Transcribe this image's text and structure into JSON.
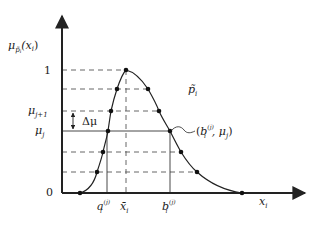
{
  "figure": {
    "type": "membership-function-diagram",
    "colors": {
      "ink": "#222222",
      "dash": "#444444",
      "background": "#ffffff"
    },
    "axes": {
      "y_label": {
        "base": "μ",
        "sub": "p̃",
        "sub2": "i",
        "arg": "(x",
        "arg_sub": "i",
        "close": ")"
      },
      "x_label": {
        "base": "x",
        "sub": "i"
      }
    },
    "y_ticks": [
      {
        "label": "1"
      },
      {
        "label_base": "μ",
        "label_sub": "j+1"
      },
      {
        "label_base": "μ",
        "label_sub": "j"
      },
      {
        "label": "0"
      }
    ],
    "x_ticks": [
      {
        "base": "a",
        "sub": "i",
        "sup": "(j)"
      },
      {
        "base": "x̄",
        "sub": "i"
      },
      {
        "base": "b",
        "sub": "i",
        "sup": "(j)"
      }
    ],
    "curve_label": {
      "base": "p̃",
      "sub": "i"
    },
    "delta_label": "Δμ",
    "point_label": {
      "open": "(",
      "base": "b",
      "sub": "i",
      "sup": "(j)",
      "sep": ", μ",
      "sep_sub": "j",
      "close": ")"
    }
  }
}
